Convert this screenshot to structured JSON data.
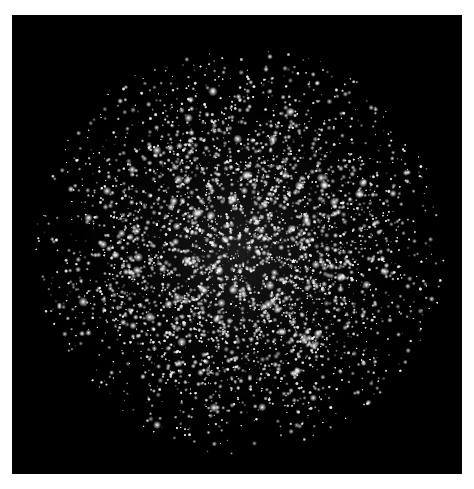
{
  "image": {
    "subject": "globular star cluster",
    "background_color": "#000000",
    "page_background": "#ffffff",
    "star_color": "#ffffff",
    "description": "Dense field of white stars on black background, concentrated toward the center"
  }
}
